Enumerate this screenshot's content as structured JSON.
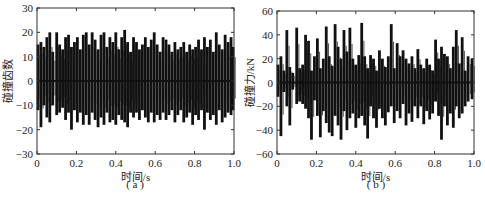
{
  "chart_data": [
    {
      "type": "line",
      "panel": "a",
      "caption": "( a )",
      "xlabel": "时间/s",
      "ylabel": "碰撞齿数",
      "xlim": [
        0,
        1.0
      ],
      "ylim": [
        -30,
        30
      ],
      "xticks": [
        "0",
        "0.2",
        "0.4",
        "0.6",
        "0.8",
        "1.0"
      ],
      "yticks": [
        "30",
        "20",
        "10",
        "0",
        "-10",
        "-20",
        "-30"
      ],
      "grid": false,
      "description": "Oscillating spike train of colliding tooth count vs time; positive peaks ~12-21, negative troughs ~-10 to -20",
      "spikes": [
        [
          0.005,
          15,
          -12
        ],
        [
          0.02,
          16,
          -19
        ],
        [
          0.035,
          14,
          -10
        ],
        [
          0.05,
          18,
          -15
        ],
        [
          0.065,
          20,
          -17
        ],
        [
          0.08,
          12,
          -10
        ],
        [
          0.1,
          20,
          -14
        ],
        [
          0.115,
          15,
          -13
        ],
        [
          0.13,
          13,
          -11
        ],
        [
          0.145,
          18,
          -16
        ],
        [
          0.16,
          19,
          -13
        ],
        [
          0.175,
          14,
          -20
        ],
        [
          0.19,
          16,
          -12
        ],
        [
          0.205,
          18,
          -17
        ],
        [
          0.22,
          13,
          -13
        ],
        [
          0.235,
          19,
          -18
        ],
        [
          0.25,
          20,
          -14
        ],
        [
          0.265,
          15,
          -18
        ],
        [
          0.28,
          20,
          -13
        ],
        [
          0.295,
          17,
          -16
        ],
        [
          0.31,
          13,
          -19
        ],
        [
          0.325,
          19,
          -15
        ],
        [
          0.34,
          20,
          -18
        ],
        [
          0.355,
          14,
          -13
        ],
        [
          0.37,
          18,
          -17
        ],
        [
          0.385,
          16,
          -16
        ],
        [
          0.4,
          20,
          -18
        ],
        [
          0.415,
          13,
          -14
        ],
        [
          0.43,
          18,
          -16
        ],
        [
          0.445,
          21,
          -17
        ],
        [
          0.46,
          16,
          -19
        ],
        [
          0.475,
          12,
          -13
        ],
        [
          0.49,
          18,
          -15
        ],
        [
          0.505,
          16,
          -13
        ],
        [
          0.52,
          13,
          -16
        ],
        [
          0.535,
          15,
          -12
        ],
        [
          0.55,
          18,
          -15
        ],
        [
          0.565,
          14,
          -17
        ],
        [
          0.58,
          17,
          -13
        ],
        [
          0.595,
          20,
          -17
        ],
        [
          0.61,
          15,
          -14
        ],
        [
          0.625,
          12,
          -16
        ],
        [
          0.64,
          18,
          -13
        ],
        [
          0.655,
          17,
          -16
        ],
        [
          0.67,
          15,
          -14
        ],
        [
          0.685,
          12,
          -12
        ],
        [
          0.7,
          16,
          -17
        ],
        [
          0.715,
          13,
          -14
        ],
        [
          0.73,
          14,
          -12
        ],
        [
          0.745,
          16,
          -17
        ],
        [
          0.76,
          12,
          -15
        ],
        [
          0.775,
          15,
          -13
        ],
        [
          0.79,
          13,
          -18
        ],
        [
          0.805,
          14,
          -14
        ],
        [
          0.82,
          17,
          -16
        ],
        [
          0.835,
          13,
          -12
        ],
        [
          0.85,
          18,
          -20
        ],
        [
          0.865,
          14,
          -13
        ],
        [
          0.88,
          17,
          -16
        ],
        [
          0.895,
          12,
          -14
        ],
        [
          0.91,
          20,
          -18
        ],
        [
          0.925,
          15,
          -12
        ],
        [
          0.94,
          13,
          -17
        ],
        [
          0.955,
          19,
          -15
        ],
        [
          0.97,
          16,
          -13
        ],
        [
          0.985,
          18,
          -14
        ],
        [
          0.995,
          14,
          -12
        ]
      ]
    },
    {
      "type": "line",
      "panel": "b",
      "caption": "( b )",
      "xlabel": "时间/s",
      "ylabel": "碰撞力/kN",
      "xlim": [
        0,
        1.0
      ],
      "ylim": [
        -60,
        60
      ],
      "xticks": [
        "0",
        "0.2",
        "0.4",
        "0.6",
        "0.8",
        "1.0"
      ],
      "yticks": [
        "60",
        "40",
        "20",
        "0",
        "-20",
        "-40",
        "-60"
      ],
      "grid": false,
      "description": "Collision force spike train vs time; peaks up to ~50 kN, troughs to ~-48 kN",
      "spikes": [
        [
          0.005,
          15,
          -12
        ],
        [
          0.02,
          22,
          -45
        ],
        [
          0.035,
          10,
          -8
        ],
        [
          0.05,
          44,
          -20
        ],
        [
          0.065,
          13,
          -36
        ],
        [
          0.08,
          8,
          -6
        ],
        [
          0.1,
          46,
          -18
        ],
        [
          0.115,
          12,
          -16
        ],
        [
          0.13,
          15,
          -18
        ],
        [
          0.145,
          40,
          -22
        ],
        [
          0.16,
          35,
          -30
        ],
        [
          0.175,
          10,
          -48
        ],
        [
          0.19,
          22,
          -15
        ],
        [
          0.205,
          37,
          -28
        ],
        [
          0.22,
          12,
          -46
        ],
        [
          0.235,
          20,
          -24
        ],
        [
          0.25,
          47,
          -34
        ],
        [
          0.265,
          22,
          -42
        ],
        [
          0.28,
          14,
          -45
        ],
        [
          0.295,
          49,
          -28
        ],
        [
          0.31,
          30,
          -36
        ],
        [
          0.325,
          20,
          -48
        ],
        [
          0.34,
          44,
          -24
        ],
        [
          0.355,
          26,
          -40
        ],
        [
          0.37,
          46,
          -30
        ],
        [
          0.385,
          20,
          -26
        ],
        [
          0.4,
          15,
          -38
        ],
        [
          0.415,
          23,
          -30
        ],
        [
          0.43,
          50,
          -28
        ],
        [
          0.445,
          22,
          -36
        ],
        [
          0.46,
          12,
          -47
        ],
        [
          0.475,
          23,
          -20
        ],
        [
          0.49,
          20,
          -30
        ],
        [
          0.505,
          10,
          -38
        ],
        [
          0.52,
          27,
          -22
        ],
        [
          0.535,
          20,
          -30
        ],
        [
          0.55,
          13,
          -36
        ],
        [
          0.565,
          22,
          -25
        ],
        [
          0.58,
          49,
          -20
        ],
        [
          0.595,
          12,
          -34
        ],
        [
          0.61,
          33,
          -24
        ],
        [
          0.625,
          22,
          -30
        ],
        [
          0.64,
          27,
          -18
        ],
        [
          0.655,
          20,
          -36
        ],
        [
          0.67,
          16,
          -26
        ],
        [
          0.685,
          22,
          -33
        ],
        [
          0.7,
          12,
          -20
        ],
        [
          0.715,
          28,
          -30
        ],
        [
          0.73,
          15,
          -20
        ],
        [
          0.745,
          12,
          -35
        ],
        [
          0.76,
          20,
          -24
        ],
        [
          0.775,
          15,
          -31
        ],
        [
          0.79,
          10,
          -26
        ],
        [
          0.805,
          36,
          -16
        ],
        [
          0.82,
          20,
          -28
        ],
        [
          0.835,
          30,
          -48
        ],
        [
          0.85,
          24,
          -20
        ],
        [
          0.865,
          22,
          -36
        ],
        [
          0.88,
          12,
          -26
        ],
        [
          0.895,
          30,
          -38
        ],
        [
          0.91,
          44,
          -20
        ],
        [
          0.925,
          16,
          -30
        ],
        [
          0.94,
          38,
          -26
        ],
        [
          0.955,
          10,
          -20
        ],
        [
          0.97,
          22,
          -16
        ],
        [
          0.99,
          20,
          -14
        ]
      ]
    }
  ],
  "panels": {
    "a": {
      "caption": "( a )",
      "xlabel": "时间/s",
      "ylabel": "碰撞齿数"
    },
    "b": {
      "caption": "( b )",
      "xlabel": "时间/s",
      "ylabel": "碰撞力/kN"
    }
  }
}
